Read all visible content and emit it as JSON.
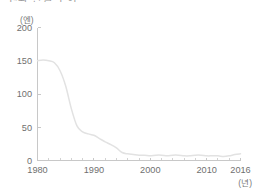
{
  "chart_title": "엔화 환율 추이",
  "y_unit": "(엔)",
  "x_unit": "(년)",
  "colors": {
    "line": "#e2e2e2",
    "axis": "#c8c8c8",
    "text": "#6f6f6f",
    "background": "#ffffff"
  },
  "chart_data": {
    "type": "line",
    "title": "엔화 환율 추이",
    "xlabel": "(년)",
    "ylabel": "(엔)",
    "xlim": [
      1980,
      2016
    ],
    "ylim": [
      0,
      200
    ],
    "grid": false,
    "legend": "none",
    "y_ticks": [
      0,
      50,
      100,
      150,
      200
    ],
    "x_ticks": [
      1980,
      1990,
      2000,
      2010,
      2016
    ],
    "x_tick_labels": [
      "1980",
      "1990",
      "2000",
      "2010",
      "2016"
    ],
    "y_tick_labels": [
      "0",
      "50",
      "100",
      "150",
      "200"
    ],
    "x_minor_tick_interval": 2,
    "series": [
      {
        "name": "엔",
        "x": [
          1980,
          1981,
          1982,
          1983,
          1984,
          1985,
          1986,
          1987,
          1988,
          1989,
          1990,
          1991,
          1992,
          1993,
          1994,
          1995,
          1996,
          1997,
          1998,
          1999,
          2000,
          2001,
          2002,
          2003,
          2004,
          2005,
          2006,
          2007,
          2008,
          2009,
          2010,
          2011,
          2012,
          2013,
          2014,
          2015,
          2016
        ],
        "values": [
          150,
          151,
          150,
          147,
          135,
          112,
          78,
          52,
          43,
          40,
          38,
          33,
          28,
          24,
          19,
          12,
          10,
          9,
          8,
          8,
          7,
          8,
          8,
          7,
          8,
          8,
          7,
          7,
          8,
          8,
          7,
          7,
          7,
          6,
          7,
          9,
          10
        ]
      }
    ]
  }
}
